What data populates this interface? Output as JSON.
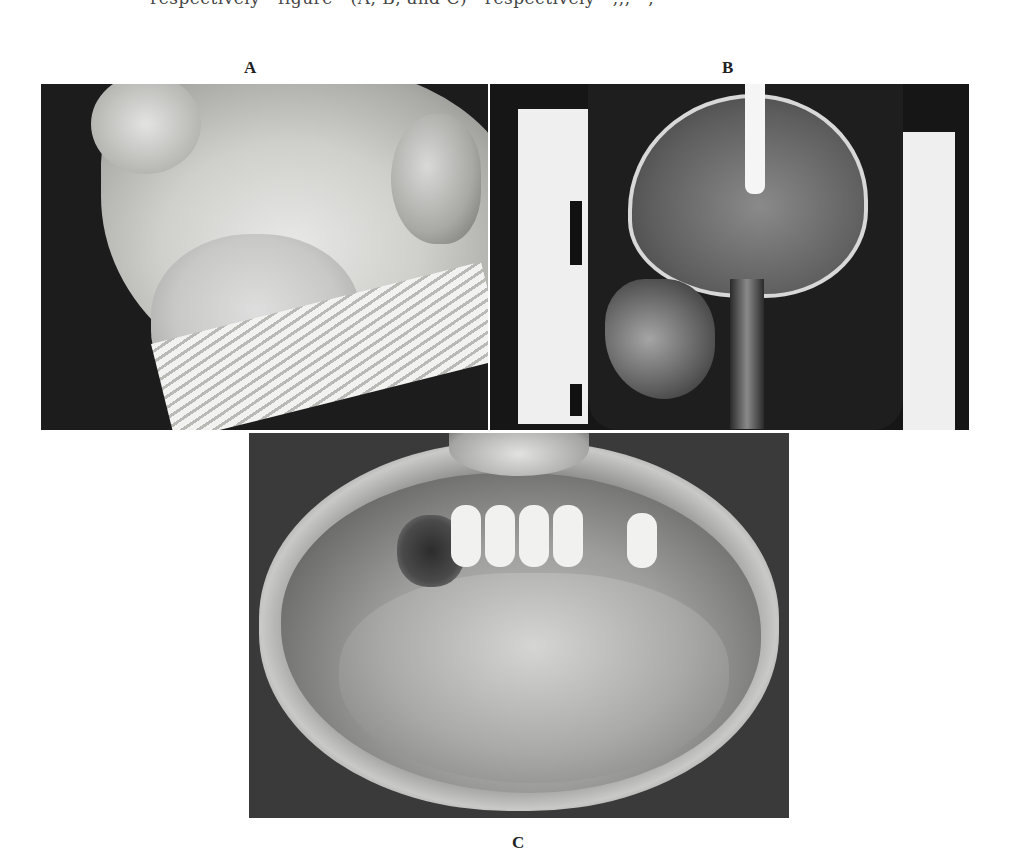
{
  "page": {
    "top_line_text": "respectively · figure · (A, B, and C) · respectively · ,,, · ,",
    "figure": {
      "panels": [
        {
          "label": "A",
          "description": "Lateral view of patient's face showing swelling of the lower jaw and submandibular region"
        },
        {
          "label": "B",
          "description": "Lateral skull radiograph"
        },
        {
          "label": "C",
          "description": "Intraoral view showing lesion of the mandibular gingiva/floor of mouth with lower anterior teeth"
        }
      ]
    }
  }
}
